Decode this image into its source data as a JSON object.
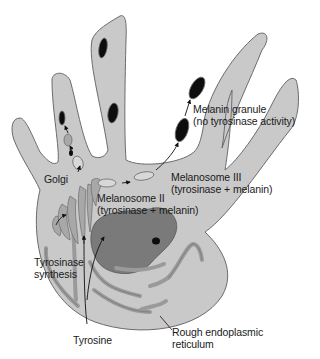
{
  "figure": {
    "type": "melanocyte-diagram",
    "colors": {
      "background": "#ffffff",
      "cell_fill": "#c9c9c9",
      "cell_outline": "#6b6b6b",
      "organelle_fill": "#9a9a9a",
      "nucleus_fill": "#7a7a7a",
      "melanin": "#0d0d0d",
      "text": "#1a1a1a"
    }
  },
  "labels": {
    "melanin_granule_line1": "Melanin granule",
    "melanin_granule_line2": "(no tyrosinase activity)",
    "golgi": "Golgi",
    "melanosome_iii_line1": "Melanosome III",
    "melanosome_iii_line2": "(tyrosinase + melanin)",
    "melanosome_ii_line1": "Melanosome II",
    "melanosome_ii_line2": "(tyrosinase + melanin)",
    "tyrosinase_synthesis_line1": "Tyrosinase",
    "tyrosinase_synthesis_line2": "synthesis",
    "tyrosine": "Tyrosine",
    "rer_line1": "Rough endoplasmic",
    "rer_line2": "reticulum"
  }
}
